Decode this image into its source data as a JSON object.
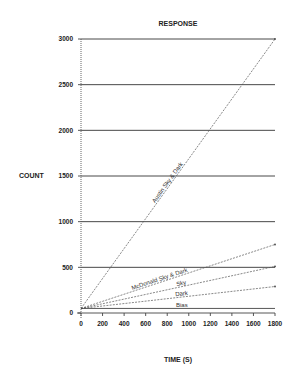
{
  "chart_data": {
    "type": "line",
    "title": "RESPONSE",
    "xlabel": "TIME (S)",
    "ylabel": "COUNT",
    "xlim": [
      0,
      1800
    ],
    "ylim": [
      0,
      3000
    ],
    "x_ticks": [
      0,
      200,
      400,
      600,
      800,
      1000,
      1200,
      1400,
      1600,
      1800
    ],
    "y_ticks": [
      0,
      500,
      1000,
      1500,
      2000,
      2500,
      3000
    ],
    "grid": "horizontal lines at 500 intervals",
    "legend": "inline labels on lines",
    "x": [
      0,
      1800
    ],
    "series": [
      {
        "name": "Austin Sky & Dark",
        "values": [
          50,
          3000
        ],
        "style": "dashed"
      },
      {
        "name": "McDonald Sky & Dark",
        "values": [
          50,
          750
        ],
        "style": "dashed"
      },
      {
        "name": "Sky",
        "values": [
          50,
          510
        ],
        "style": "dashed"
      },
      {
        "name": "Dark",
        "values": [
          50,
          290
        ],
        "style": "dashed"
      },
      {
        "name": "Bias",
        "values": [
          50,
          50
        ],
        "style": "solid"
      }
    ]
  }
}
